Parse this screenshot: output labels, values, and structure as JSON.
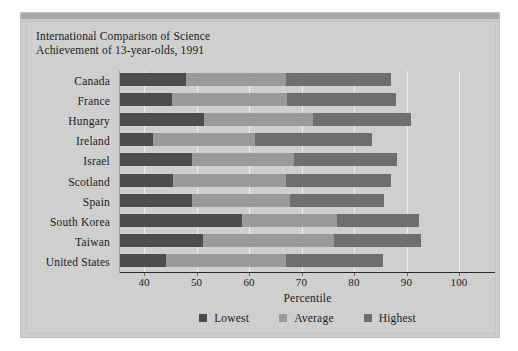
{
  "chart_data": {
    "type": "bar",
    "subtype": "stacked-horizontal-range",
    "title": "International Comparison of Science Achievement of 13-year-olds, 1991",
    "title_lines": [
      "International Comparison of Science",
      "Achievement of 13-year-olds, 1991"
    ],
    "xlabel": "Percentile",
    "ylabel": "",
    "xlim": [
      35.4,
      104
    ],
    "xticks": [
      40,
      50,
      60,
      70,
      80,
      90,
      100
    ],
    "xticklabels": [
      "40",
      "50",
      "60",
      "70",
      "80",
      "90",
      "100"
    ],
    "grid": true,
    "grid_axis": "x",
    "legend_position": "bottom",
    "orientation": "horizontal",
    "categories": [
      "Canada",
      "France",
      "Hungary",
      "Ireland",
      "Israel",
      "Scotland",
      "Spain",
      "South Korea",
      "Taiwan",
      "United States"
    ],
    "series": [
      {
        "name": "Lowest",
        "color": "#4c4c4c",
        "values": [
          47.9,
          45.3,
          51.5,
          41.6,
          49.2,
          45.5,
          49.2,
          58.7,
          51.3,
          44.2
        ]
      },
      {
        "name": "Average",
        "color": "#9a9a9a",
        "values": [
          67.1,
          67.3,
          72.1,
          61.1,
          68.6,
          67.1,
          67.8,
          76.8,
          76.1,
          67.1
        ]
      },
      {
        "name": "Highest",
        "color": "#6e6e6e",
        "values": [
          87.1,
          88.0,
          90.9,
          83.5,
          88.2,
          87.1,
          85.7,
          92.3,
          92.8,
          85.5
        ]
      }
    ],
    "legend": [
      {
        "label": "Lowest",
        "color": "#4c4c4c"
      },
      {
        "label": "Average",
        "color": "#9a9a9a"
      },
      {
        "label": "Highest",
        "color": "#6e6e6e"
      }
    ]
  },
  "colors": {
    "plate_background": "#cdcdcd",
    "chart_background": "#cfcfcf",
    "topbar": "#a8a8a8",
    "gridline": "#eeeeee",
    "axis": "#2a2a2a",
    "text": "#1b1b1b"
  }
}
